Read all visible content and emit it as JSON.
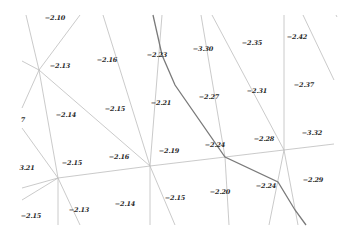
{
  "diagram": {
    "background": "#ffffff",
    "colors": {
      "thin_line": "#bdbdbd",
      "thick_line": "#7a7a7a",
      "label": "#2a2a2a"
    },
    "thin_lines": [
      [
        [
          26,
          15
        ],
        [
          39,
          70
        ]
      ],
      [
        [
          80,
          15
        ],
        [
          39,
          70
        ]
      ],
      [
        [
          22,
          61
        ],
        [
          39,
          70
        ]
      ],
      [
        [
          39,
          70
        ],
        [
          22,
          108
        ]
      ],
      [
        [
          39,
          70
        ],
        [
          58,
          178
        ]
      ],
      [
        [
          39,
          70
        ],
        [
          150,
          166
        ]
      ],
      [
        [
          22,
          128
        ],
        [
          58,
          178
        ]
      ],
      [
        [
          22,
          188
        ],
        [
          58,
          178
        ]
      ],
      [
        [
          22,
          200
        ],
        [
          58,
          178
        ]
      ],
      [
        [
          58,
          178
        ],
        [
          58,
          225
        ]
      ],
      [
        [
          58,
          178
        ],
        [
          80,
          225
        ]
      ],
      [
        [
          58,
          178
        ],
        [
          150,
          166
        ]
      ],
      [
        [
          150,
          166
        ],
        [
          334,
          144
        ]
      ],
      [
        [
          103,
          15
        ],
        [
          150,
          166
        ]
      ],
      [
        [
          162,
          15
        ],
        [
          150,
          166
        ]
      ],
      [
        [
          150,
          166
        ],
        [
          150,
          225
        ]
      ],
      [
        [
          150,
          166
        ],
        [
          175,
          225
        ]
      ],
      [
        [
          201,
          15
        ],
        [
          225,
          157
        ]
      ],
      [
        [
          225,
          157
        ],
        [
          229,
          225
        ]
      ],
      [
        [
          212,
          15
        ],
        [
          284,
          150
        ]
      ],
      [
        [
          284,
          150
        ],
        [
          284,
          15
        ]
      ],
      [
        [
          284,
          150
        ],
        [
          269,
          225
        ]
      ],
      [
        [
          284,
          150
        ],
        [
          298,
          225
        ]
      ],
      [
        [
          303,
          15
        ],
        [
          334,
          80
        ]
      ],
      [
        [
          336,
          15
        ],
        [
          337,
          17
        ]
      ]
    ],
    "thick_lines": [
      [
        [
          153,
          15
        ],
        [
          162,
          55
        ],
        [
          175,
          85
        ],
        [
          225,
          157
        ],
        [
          278,
          182
        ],
        [
          295,
          210
        ],
        [
          306,
          225
        ]
      ]
    ],
    "labels": [
      {
        "text": "−2.10",
        "x": 55,
        "y": 18
      },
      {
        "text": "−2.13",
        "x": 60,
        "y": 66
      },
      {
        "text": "−2.16",
        "x": 107,
        "y": 60
      },
      {
        "text": "−2.23",
        "x": 157,
        "y": 55
      },
      {
        "text": "−3.30",
        "x": 203,
        "y": 49
      },
      {
        "text": "−2.35",
        "x": 252,
        "y": 43
      },
      {
        "text": "−2.42",
        "x": 297,
        "y": 37
      },
      {
        "text": "−2.37",
        "x": 304,
        "y": 85
      },
      {
        "text": "−2.31",
        "x": 257,
        "y": 91
      },
      {
        "text": "−2.27",
        "x": 209,
        "y": 97
      },
      {
        "text": "−2.21",
        "x": 161,
        "y": 103
      },
      {
        "text": "−2.15",
        "x": 115,
        "y": 109
      },
      {
        "text": "−2.14",
        "x": 66,
        "y": 115
      },
      {
        "text": "7",
        "x": 23,
        "y": 120
      },
      {
        "text": "−2.19",
        "x": 169,
        "y": 151
      },
      {
        "text": "−2.24",
        "x": 215,
        "y": 145
      },
      {
        "text": "−2.28",
        "x": 264,
        "y": 139
      },
      {
        "text": "−3.32",
        "x": 312,
        "y": 133
      },
      {
        "text": "−2.16",
        "x": 119,
        "y": 157
      },
      {
        "text": "−2.15",
        "x": 72,
        "y": 163
      },
      {
        "text": "3.21",
        "x": 27,
        "y": 168
      },
      {
        "text": "−2.20",
        "x": 220,
        "y": 192
      },
      {
        "text": "−2.24",
        "x": 266,
        "y": 186
      },
      {
        "text": "−2.29",
        "x": 313,
        "y": 180
      },
      {
        "text": "−2.15",
        "x": 175,
        "y": 198
      },
      {
        "text": "−2.14",
        "x": 125,
        "y": 204
      },
      {
        "text": "−2.13",
        "x": 79,
        "y": 210
      },
      {
        "text": "−2.15",
        "x": 31,
        "y": 216
      }
    ]
  }
}
